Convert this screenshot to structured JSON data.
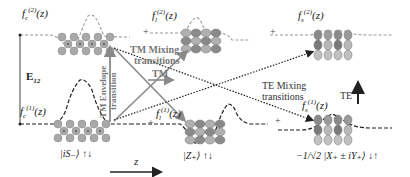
{
  "diagram": {
    "energy_label": "E",
    "energy_sub": "12",
    "axis_label": "z",
    "upper_states": [
      {
        "name": "f",
        "sub": "c",
        "sup": "(2)",
        "arg": "(z)"
      },
      {
        "name": "f",
        "sub": "l",
        "sup": "(2)",
        "arg": "(z)"
      },
      {
        "name": "f",
        "sub": "s",
        "sup": "(2)",
        "arg": "(z)"
      }
    ],
    "lower_states": [
      {
        "name": "f",
        "sub": "c",
        "sup": "(1)",
        "arg": "(z)"
      },
      {
        "name": "f",
        "sub": "l",
        "sup": "(1)",
        "arg": "(z)"
      },
      {
        "name": "f",
        "sub": "s",
        "sup": "(1)",
        "arg": "(z)"
      }
    ],
    "plus_sign": "+",
    "basis_states": [
      {
        "label": "|iS₋⟩ ↑↓"
      },
      {
        "label": "|Z₊⟩ ↑↓"
      },
      {
        "prefix": "−",
        "frac": "1/√2",
        "label": "|X₊ ± iY₊⟩ ↓↑"
      }
    ],
    "transitions": {
      "tm_envelope": "TM Envelope transition",
      "tm_envelope_line1": "TM Envelope",
      "tm_envelope_line2": "transition",
      "tm_mixing_line1": "TM Mixing",
      "tm_mixing_line2": "transitions",
      "tm_arrow": "TM",
      "te_mixing_line1": "TE Mixing",
      "te_mixing_line2": "transitions",
      "te_arrow": "TE"
    },
    "colors": {
      "dashed_gray": "#9a9a9a",
      "dashed_black": "#222222",
      "arrow_gray": "#8a8a8a",
      "atom_gray": "#a8a8a8",
      "atom_dark": "#7a7a7a"
    }
  }
}
